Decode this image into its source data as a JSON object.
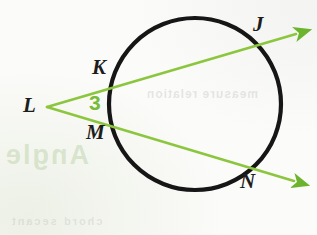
{
  "figure": {
    "kind": "circle-with-two-secants",
    "background_color": "#fbfbf9",
    "circle": {
      "name": "circle",
      "center_x": 195,
      "center_y": 104,
      "radius": 86,
      "stroke_color": "#161616",
      "stroke_width": 4.2
    },
    "rays": [
      {
        "name": "secant-L-K-J",
        "from": "L",
        "through": [
          "K",
          "J"
        ],
        "x1": 47,
        "y1": 107,
        "x2": 300,
        "y2": 33,
        "color": "#8cc63f"
      },
      {
        "name": "secant-L-M-N",
        "from": "L",
        "through": [
          "M",
          "N"
        ],
        "x1": 47,
        "y1": 107,
        "x2": 298,
        "y2": 182,
        "color": "#8cc63f"
      }
    ],
    "ray_stroke_width": 2.6,
    "arrowhead_color": "#6cb32e",
    "points": [
      {
        "id": "J",
        "label": "J",
        "x": 257,
        "y": 45
      },
      {
        "id": "K",
        "label": "K",
        "x": 113,
        "y": 82
      },
      {
        "id": "L",
        "label": "L",
        "x": 47,
        "y": 107
      },
      {
        "id": "M",
        "label": "M",
        "x": 113,
        "y": 122
      },
      {
        "id": "N",
        "label": "N",
        "x": 252,
        "y": 166
      }
    ],
    "angle": {
      "name": "angle-3",
      "label": "3",
      "vertex": "L",
      "color": "#78bb36"
    },
    "show_through": {
      "lower_left": "Angle",
      "inner": "measure relation",
      "bottom": "chord secant"
    }
  }
}
